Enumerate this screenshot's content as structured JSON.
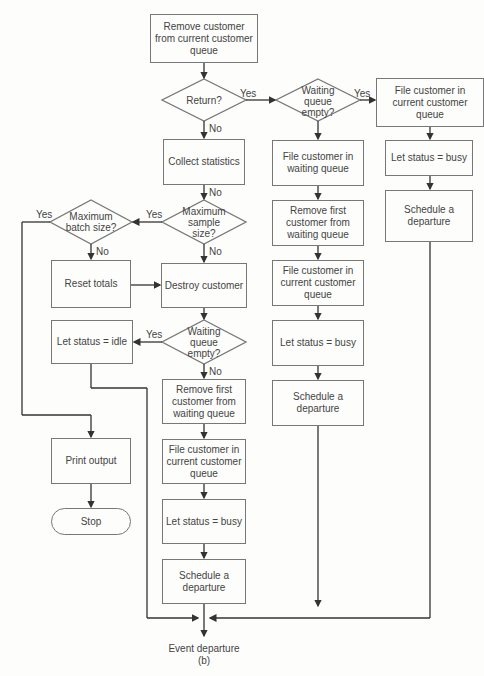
{
  "diagram": {
    "title": "Event departure",
    "subtitle": "(b)",
    "nodes": {
      "remove_current": "Remove customer from current customer queue",
      "return_q": "Return?",
      "waiting_empty_top": "Waiting queue empty?",
      "file_current_right": "File customer in current customer queue",
      "let_busy_right": "Let status = busy",
      "schedule_right": "Schedule a departure",
      "collect_stats": "Collect statistics",
      "file_waiting": "File customer in waiting queue",
      "remove_first_mid": "Remove first customer from waiting queue",
      "file_current_mid": "File customer in current customer queue",
      "let_busy_mid": "Let status = busy",
      "schedule_mid": "Schedule a departure",
      "max_sample": "Maximum sample size?",
      "max_batch": "Maximum batch size?",
      "reset_totals": "Reset totals",
      "destroy_customer": "Destroy customer",
      "waiting_empty_low": "Waiting queue empty?",
      "let_idle": "Let status = idle",
      "print_output": "Print output",
      "stop": "Stop",
      "remove_first_low": "Remove first customer from waiting queue",
      "file_current_low": "File customer in current customer queue",
      "let_busy_low": "Let status = busy",
      "schedule_low": "Schedule a departure"
    },
    "labels": {
      "yes": "Yes",
      "no": "No"
    },
    "colors": {
      "line": "#333333",
      "border": "#777777",
      "background": "#fdfdfb"
    }
  }
}
